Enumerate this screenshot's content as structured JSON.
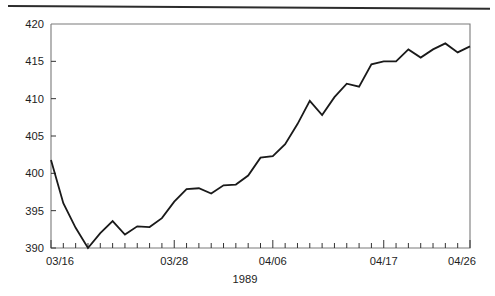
{
  "page": {
    "background_color": "#ffffff",
    "rule_color": "#2c2c2c"
  },
  "chart_data": {
    "type": "line",
    "title": "",
    "subtitle": "",
    "xlabel": "1989",
    "ylabel": "",
    "ylim": [
      390,
      420
    ],
    "xlim": [
      "03/16",
      "04/26"
    ],
    "y_ticks": [
      390,
      395,
      400,
      405,
      410,
      415,
      420
    ],
    "y_tick_labels": [
      "390",
      "395",
      "400",
      "405",
      "410",
      "415",
      "420"
    ],
    "x_tick_labels": [
      "03/16",
      "03/28",
      "04/06",
      "04/17",
      "04/26"
    ],
    "x_labeled_indices": [
      0,
      10,
      18,
      27,
      34
    ],
    "n_x_ticks": 35,
    "grid": false,
    "legend": null,
    "line_color": "#1a1a1a",
    "line_width": 1.8,
    "frame_color": "#7a7a7a",
    "x": [
      "03/16",
      "03/17",
      "03/18",
      "03/19",
      "03/20",
      "03/21",
      "03/22",
      "03/23",
      "03/24",
      "03/25",
      "03/28",
      "03/29",
      "03/30",
      "03/31",
      "04/01",
      "04/02",
      "04/03",
      "04/04",
      "04/06",
      "04/07",
      "04/08",
      "04/09",
      "04/10",
      "04/11",
      "04/12",
      "04/13",
      "04/14",
      "04/17",
      "04/18",
      "04/19",
      "04/20",
      "04/21",
      "04/24",
      "04/25",
      "04/26"
    ],
    "values": [
      401.8,
      396.0,
      392.7,
      390.0,
      392.0,
      393.6,
      391.8,
      392.9,
      392.8,
      394.0,
      396.2,
      397.9,
      398.0,
      397.3,
      398.4,
      398.5,
      399.7,
      402.1,
      402.3,
      403.9,
      406.6,
      409.7,
      407.8,
      410.2,
      412.0,
      411.6,
      414.6,
      415.0,
      415.0,
      416.6,
      415.5,
      416.6,
      417.4,
      416.2,
      417.0
    ],
    "annotations": []
  }
}
